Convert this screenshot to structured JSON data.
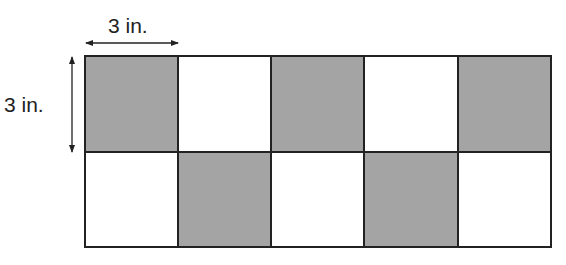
{
  "diagram": {
    "width_label": "3 in.",
    "height_label": "3 in.",
    "rows": 2,
    "columns": 5,
    "cell_size_in": 3,
    "pattern": [
      [
        "shaded",
        "white",
        "shaded",
        "white",
        "shaded"
      ],
      [
        "white",
        "shaded",
        "white",
        "shaded",
        "white"
      ]
    ],
    "colors": {
      "shaded": "#a4a4a4",
      "white": "#ffffff",
      "border": "#222222"
    }
  }
}
